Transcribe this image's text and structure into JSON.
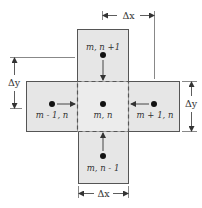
{
  "diagram": {
    "type": "finite-difference-stencil",
    "colors": {
      "cell_fill": "#e6e6e6",
      "center_fill": "#ececec",
      "stroke": "#555555",
      "node": "#111111"
    },
    "nodes": {
      "center": {
        "label": "m, n"
      },
      "top": {
        "label": "m, n +1"
      },
      "left": {
        "label": "m - 1, n"
      },
      "right": {
        "label": "m + 1, n"
      },
      "bottom": {
        "label": "m, n - 1"
      }
    },
    "dimensions": {
      "top_dx": "Δx",
      "bottom_dx": "Δx",
      "left_dy": "Δy",
      "right_dy": "Δy"
    }
  }
}
